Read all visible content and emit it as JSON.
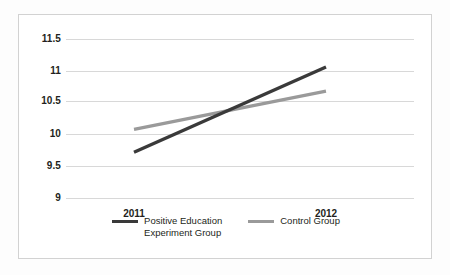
{
  "chart_data": {
    "type": "line",
    "title": "",
    "xlabel": "",
    "ylabel": "",
    "categories": [
      "2011",
      "2012"
    ],
    "x": [
      2011,
      2012
    ],
    "ylim": [
      9,
      11.5
    ],
    "yticks": [
      9,
      9.5,
      10,
      10.5,
      11,
      11.5
    ],
    "ytick_labels": [
      "9",
      "9.5",
      "10",
      "10.5",
      "11",
      "11.5"
    ],
    "grid": true,
    "legend_position": "bottom",
    "series": [
      {
        "name": "Positive Education\nExperiment Group",
        "name_flat": "Positive Education Experiment Group",
        "values": [
          9.72,
          11.06
        ],
        "color": "#3a3a3a",
        "line_width": 3
      },
      {
        "name": "Control Group",
        "name_flat": "Control Group",
        "values": [
          10.08,
          10.68
        ],
        "color": "#9a9a9a",
        "line_width": 3
      }
    ]
  },
  "axis": {
    "y_labels": [
      "11.5",
      "11",
      "10.5",
      "10",
      "9.5",
      "9"
    ],
    "x_labels": [
      "2011",
      "2012"
    ]
  },
  "legend": {
    "items": [
      {
        "label": "Positive Education\nExperiment Group",
        "color": "#3a3a3a"
      },
      {
        "label": "Control Group",
        "color": "#9a9a9a"
      }
    ]
  },
  "colors": {
    "frame_border": "#d2d2d2",
    "gridline": "#d8d8d8",
    "background": "#ffffff",
    "text": "#231f20",
    "experiment_series": "#3a3a3a",
    "control_series": "#9a9a9a"
  }
}
